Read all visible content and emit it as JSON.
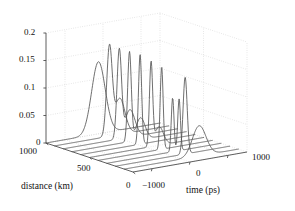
{
  "figure": {
    "kind": "matlab-3d-waterfall",
    "background": "#ffffff",
    "curve_color": "#555555",
    "axis_color": "#4d4d4d",
    "grid_color": "#c8c8c8"
  },
  "chart_data": {
    "type": "line",
    "title": "",
    "subtitle": "",
    "projection": "3d-waterfall",
    "xlabel": "time (ps)",
    "ylabel": "distance (km)",
    "zlabel": "",
    "xlim": [
      -1500,
      1500
    ],
    "ylim": [
      0,
      1000
    ],
    "zlim": [
      0,
      0.2
    ],
    "xticks": [
      -1000,
      0,
      1000
    ],
    "xticklabels": [
      "−1000",
      "0",
      "1000"
    ],
    "yticks": [
      0,
      500,
      1000
    ],
    "yticklabels": [
      "0",
      "500",
      "1000"
    ],
    "zticks": [
      0,
      0.05,
      0.1,
      0.15,
      0.2
    ],
    "zticklabels": [
      "0",
      "0.05",
      "0.1",
      "0.15",
      "0.2"
    ],
    "grid": true,
    "legend": false,
    "legend_position": "none",
    "annotations": [],
    "series": [
      {
        "name": "distance = 1000 km",
        "y": 1000,
        "peaks": [
          {
            "t": -120,
            "amp": 0.131,
            "width": 300
          }
        ],
        "note": "broad single pulse, lowest peak of the rear traces"
      },
      {
        "name": "distance = 900 km",
        "y": 900,
        "peaks": [
          {
            "t": -60,
            "amp": 0.158,
            "width": 120
          },
          {
            "t": 210,
            "amp": 0.066,
            "width": 230
          }
        ],
        "note": "tall narrow main pulse with trailing shoulder"
      },
      {
        "name": "distance = 800 km",
        "y": 800,
        "peaks": [
          {
            "t": -30,
            "amp": 0.16,
            "width": 100
          },
          {
            "t": 250,
            "amp": 0.05,
            "width": 220
          }
        ],
        "note": "tall narrow pulse"
      },
      {
        "name": "distance = 700 km",
        "y": 700,
        "peaks": [
          {
            "t": 10,
            "amp": 0.162,
            "width": 80
          },
          {
            "t": 300,
            "amp": 0.04,
            "width": 200
          }
        ],
        "note": "very narrow spike"
      },
      {
        "name": "distance = 600 km",
        "y": 600,
        "peaks": [
          {
            "t": 60,
            "amp": 0.163,
            "width": 70
          }
        ],
        "note": "narrow spike"
      },
      {
        "name": "distance = 500 km",
        "y": 500,
        "peaks": [
          {
            "t": 120,
            "amp": 0.15,
            "width": 70
          },
          {
            "t": 330,
            "amp": 0.034,
            "width": 190
          }
        ],
        "note": "narrow spike, slightly lower"
      },
      {
        "name": "distance = 400 km",
        "y": 400,
        "peaks": [
          {
            "t": 170,
            "amp": 0.15,
            "width": 65
          }
        ],
        "note": "narrow spike"
      },
      {
        "name": "distance = 300 km",
        "y": 300,
        "peaks": [
          {
            "t": 230,
            "amp": 0.098,
            "width": 60
          },
          {
            "t": 400,
            "amp": 0.094,
            "width": 60
          }
        ],
        "note": "split double-humped (M shaped) pulse"
      },
      {
        "name": "distance = 200 km",
        "y": 200,
        "peaks": [
          {
            "t": 330,
            "amp": 0.14,
            "width": 90
          }
        ],
        "note": "narrow pulse"
      },
      {
        "name": "distance = 100 km",
        "y": 100,
        "peaks": [
          {
            "t": 470,
            "amp": 0.055,
            "width": 300
          }
        ],
        "note": "broad low front pulse"
      }
    ]
  },
  "axes": {
    "z": {
      "ticks": [
        {
          "label": "0.2",
          "value": 0.2
        },
        {
          "label": "0.15",
          "value": 0.15
        },
        {
          "label": "0.1",
          "value": 0.1
        },
        {
          "label": "0.05",
          "value": 0.05
        },
        {
          "label": "0",
          "value": 0
        }
      ]
    },
    "y": {
      "title": "distance (km)",
      "ticks": [
        {
          "label": "1000",
          "value": 1000
        },
        {
          "label": "500",
          "value": 500
        },
        {
          "label": "0",
          "value": 0
        }
      ]
    },
    "x": {
      "title": "time (ps)",
      "ticks": [
        {
          "label": "−1000",
          "value": -1000
        },
        {
          "label": "0",
          "value": 0
        },
        {
          "label": "1000",
          "value": 1000
        }
      ]
    }
  }
}
